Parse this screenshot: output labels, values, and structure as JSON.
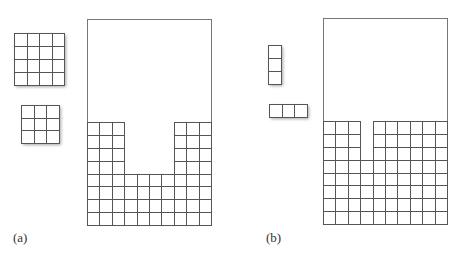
{
  "panels": [
    {
      "label": "(a)",
      "label_pos": [
        13,
        230
      ],
      "pieces": [
        {
          "name": "square-4x4",
          "x": 14,
          "y": 33,
          "cols": 4,
          "rows": 4,
          "cell_w": 12.5,
          "cell_h": 13
        },
        {
          "name": "square-3x3",
          "x": 21,
          "y": 105,
          "cols": 3,
          "rows": 3,
          "cell_w": 12.7,
          "cell_h": 12.5
        }
      ],
      "container": {
        "x": 87,
        "y": 19,
        "w": 124,
        "h": 206,
        "cols": 10,
        "rows": 8,
        "grid_top": 122
      },
      "column_heights": [
        8,
        8,
        8,
        4,
        4,
        4,
        4,
        8,
        8,
        8
      ]
    },
    {
      "label": "(b)",
      "label_pos": [
        266,
        230
      ],
      "pieces": [
        {
          "name": "bar-vertical-1x3",
          "x": 268,
          "y": 45,
          "cols": 1,
          "rows": 3,
          "cell_w": 13,
          "cell_h": 13
        },
        {
          "name": "bar-horizontal-3x1",
          "x": 269,
          "y": 104,
          "cols": 3,
          "rows": 1,
          "cell_w": 12.5,
          "cell_h": 13
        }
      ],
      "container": {
        "x": 323,
        "y": 18,
        "w": 124,
        "h": 206,
        "cols": 10,
        "rows": 8,
        "grid_top": 121
      },
      "column_heights": [
        8,
        8,
        8,
        5,
        8,
        8,
        8,
        8,
        8,
        8
      ]
    }
  ],
  "colors": {
    "line": "#555555",
    "frame": "#777777",
    "background": "#ffffff"
  }
}
